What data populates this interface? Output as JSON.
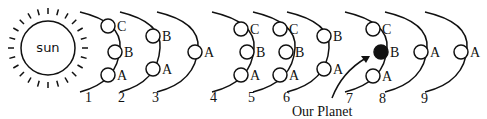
{
  "diagram": {
    "sun_label": "sun",
    "pointer_label": "Our Planet",
    "diagrams": [
      {
        "number": "1",
        "moons": [
          "C",
          "B",
          "A"
        ]
      },
      {
        "number": "2",
        "moons": [
          "B",
          "A"
        ]
      },
      {
        "number": "3",
        "moons": [
          "A"
        ]
      },
      {
        "number": "4",
        "moons": [
          "A"
        ]
      },
      {
        "number": "5",
        "moons": [
          "C",
          "B",
          "A"
        ]
      },
      {
        "number": "6",
        "moons": [
          "C",
          "B",
          "A"
        ]
      },
      {
        "number": "7",
        "moons": [
          "B",
          "A"
        ]
      },
      {
        "number": "8",
        "moons": [
          "C",
          "B (filled)",
          "A"
        ]
      },
      {
        "number": "9",
        "moons": [
          "A"
        ]
      },
      {
        "number": "",
        "moons": [
          "A"
        ]
      }
    ],
    "labels": {
      "n1": "1",
      "n2": "2",
      "n3": "3",
      "n4": "4",
      "n5": "5",
      "n6": "6",
      "n7": "7",
      "n8": "8",
      "n9": "9",
      "a": "A",
      "b": "B",
      "c": "C"
    },
    "colors": {
      "stroke": "#111111",
      "filled_planet": "#111111",
      "background": "#ffffff"
    }
  }
}
